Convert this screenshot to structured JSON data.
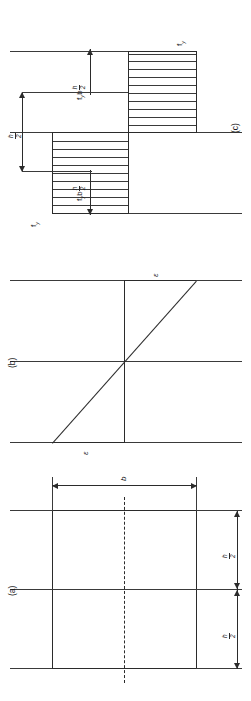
{
  "figure": {
    "orientation": "rotated-90-ccw",
    "line_color": "#2b2b2b",
    "background": "#ffffff"
  },
  "parts": [
    {
      "key": "a",
      "marker": "(a)",
      "caption": "cross-section"
    },
    {
      "key": "b",
      "marker": "(b)",
      "caption": "strain distribution"
    },
    {
      "key": "c",
      "marker": "(c)",
      "caption": "stress distribution and resultant forces"
    }
  ],
  "section_a": {
    "marker": "(a)",
    "width_label": "b",
    "half_depth_label_top": {
      "num": "h",
      "den": "2"
    },
    "half_depth_label_bottom": {
      "num": "h",
      "den": "2"
    },
    "centroid_axis": "chain-dash"
  },
  "section_b": {
    "marker": "(b)",
    "strain_top": "ε",
    "strain_bottom": "ε",
    "neutral_axis": "mid-depth"
  },
  "section_c": {
    "marker": "(c)",
    "stress_top": {
      "symbol": "f",
      "sub": "y"
    },
    "stress_bottom": {
      "symbol": "f",
      "sub": "y"
    },
    "force_compression": {
      "symbol": "f",
      "sub": "y",
      "times": "b",
      "frac": {
        "num": "h",
        "den": "2"
      }
    },
    "force_tension": {
      "symbol": "f",
      "sub": "y",
      "times": "b",
      "frac": {
        "num": "h",
        "den": "2"
      }
    },
    "lever_arm": {
      "num": "h",
      "den": "2"
    },
    "hatch_count_top": 9,
    "hatch_count_bottom": 10
  }
}
